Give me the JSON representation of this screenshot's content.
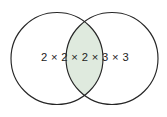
{
  "diagram": {
    "type": "venn-diagram",
    "title": "",
    "canvas": {
      "width": 167,
      "height": 117,
      "background": "#ffffff"
    },
    "sets": [
      {
        "name": "left-circle",
        "label": "",
        "center_x": 57,
        "center_y": 58.5,
        "radius": 46,
        "fill": "#ffffff",
        "stroke": "#262626"
      },
      {
        "name": "right-circle",
        "label": "",
        "center_x": 112,
        "center_y": 58.5,
        "radius": 46,
        "fill": "#ffffff",
        "stroke": "#262626"
      }
    ],
    "intersection": {
      "name": "intersection-region",
      "fill": "#dfeade",
      "top_crossing_x": 84.5,
      "top_crossing_y": 15.5,
      "bottom_crossing_x": 84.5,
      "bottom_crossing_y": 101.5
    },
    "labels": [
      {
        "name": "factorization-label",
        "text": "2 × 2 × 2 × 3 × 3",
        "x": 85,
        "y": 58,
        "color": "#232323"
      }
    ],
    "colors": {
      "stroke": "#262626",
      "intersection_fill": "#dfeade",
      "background": "#ffffff",
      "text": "#232323"
    }
  }
}
